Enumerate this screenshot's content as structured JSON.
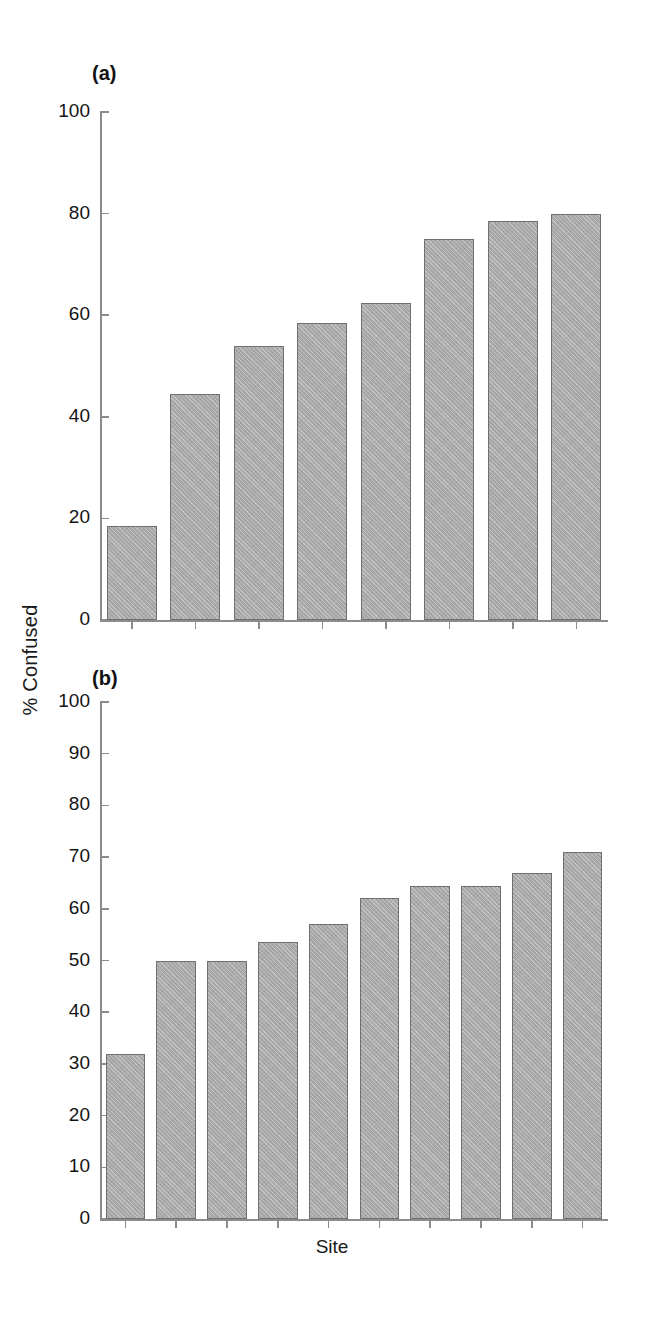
{
  "figure": {
    "ylabel": "% Confused",
    "xlabel": "Site",
    "bar_color": "#a9a9a9",
    "bar_edge_color": "#6f6f6f",
    "axis_color": "#8c8c8c"
  },
  "panels": [
    {
      "tag": "(a)",
      "ticklabels": [
        "100",
        "80",
        "60",
        "40",
        "20",
        "0"
      ]
    },
    {
      "tag": "(b)",
      "ticklabels": [
        "100",
        "90",
        "80",
        "70",
        "60",
        "50",
        "40",
        "30",
        "20",
        "10",
        "0"
      ]
    }
  ],
  "chart_data": [
    {
      "type": "bar",
      "title": "(a)",
      "xlabel": "Site",
      "ylabel": "% Confused",
      "categories": [
        "1",
        "2",
        "3",
        "4",
        "5",
        "6",
        "7",
        "8"
      ],
      "values": [
        18.5,
        44.5,
        54.0,
        58.5,
        62.5,
        75.0,
        78.5,
        80.0
      ],
      "ylim": [
        0,
        100
      ],
      "yticks": [
        0,
        20,
        40,
        60,
        80,
        100
      ],
      "grid": false,
      "legend": "none"
    },
    {
      "type": "bar",
      "title": "(b)",
      "xlabel": "Site",
      "ylabel": "% Confused",
      "categories": [
        "1",
        "2",
        "3",
        "4",
        "5",
        "6",
        "7",
        "8",
        "9",
        "10"
      ],
      "values": [
        32.0,
        50.0,
        50.0,
        53.5,
        57.0,
        62.0,
        64.5,
        64.5,
        67.0,
        71.0
      ],
      "ylim": [
        0,
        100
      ],
      "yticks": [
        0,
        10,
        20,
        30,
        40,
        50,
        60,
        70,
        80,
        90,
        100
      ],
      "grid": false,
      "legend": "none"
    }
  ]
}
